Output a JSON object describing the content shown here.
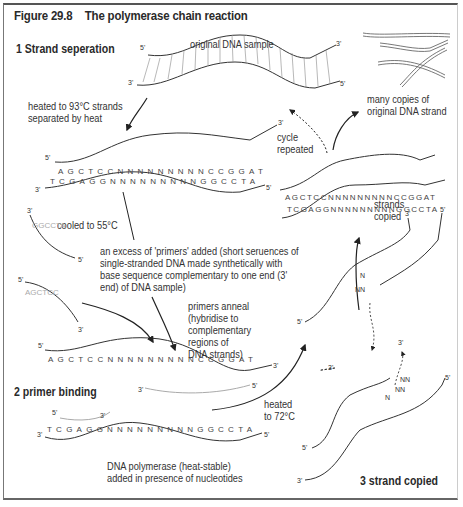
{
  "figure": {
    "number": "Figure 29.8",
    "title": "The polymerase chain reaction"
  },
  "steps": [
    {
      "label": "1  Strand seperation"
    },
    {
      "label": "2 primer binding"
    },
    {
      "label": "3 strand copied"
    }
  ],
  "labels": {
    "original_sample": "original DNA sample",
    "heated_93": "heated to 93°C strands separated by heat",
    "cooled_55": "cooled to 55°C",
    "primers_added": "an excess of 'primers' added (short seruences of single-stranded DNA made synthetically with base sequence complementary to one end (3' end) of DNA sample)",
    "primers_anneal": "primers anneal (hybridise to complementary regions of DNA strands)",
    "heated_72": "heated to 72°C",
    "polymerase": "DNA polymerase (heat-stable) added in presence of nucleotides",
    "strands_copied": "strands copied",
    "cycle_repeated": "cycle repeated",
    "many_copies": "many copies of original DNA strand"
  },
  "sequences": {
    "top_strand": "AGCTCCNNNNNNNNNCCGGAT",
    "bottom_strand": "TCGAGGNNNNNNNNNGGCCTA",
    "primer_1": "GGCCTA",
    "primer_2": "AGCTCC"
  },
  "end_labels": {
    "five": "5'",
    "three": "3'"
  },
  "nucleotides": {
    "n": "N",
    "nn": "NN"
  }
}
